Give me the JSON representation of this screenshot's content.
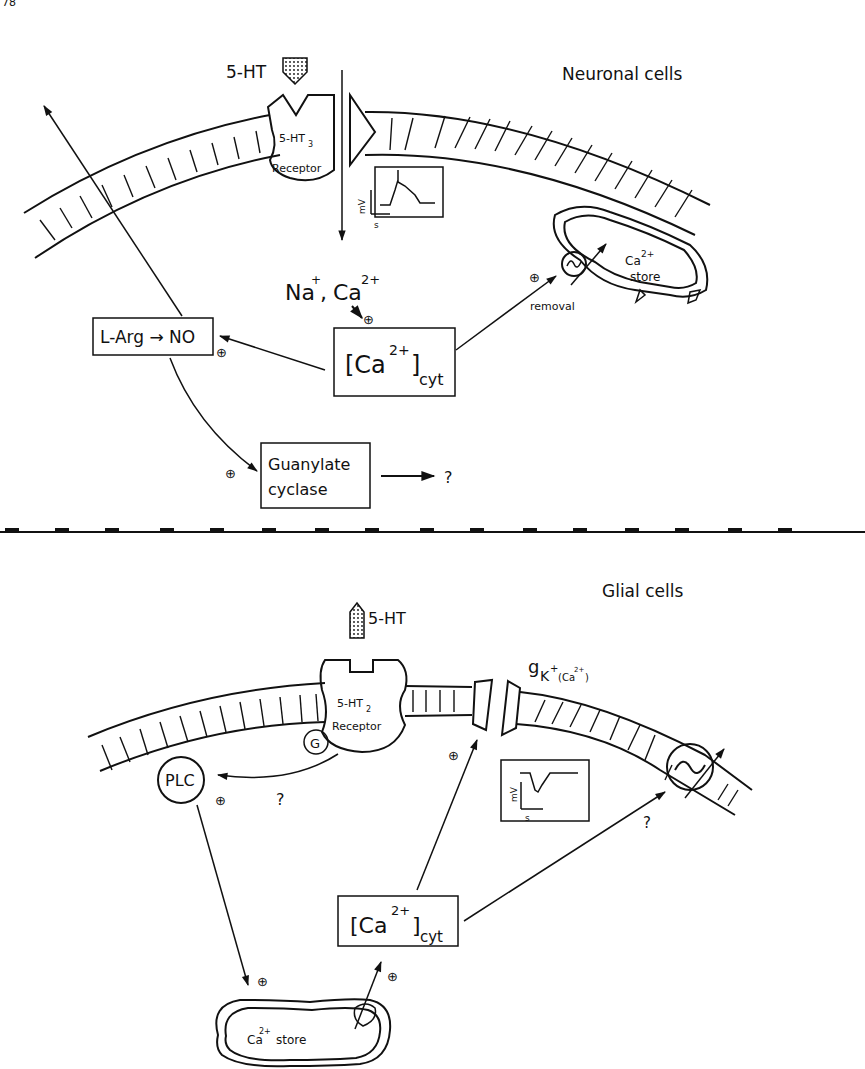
{
  "figure": {
    "page_fragment": "78",
    "panels": [
      {
        "id": "neuronal",
        "title": "Neuronal cells",
        "ligand": "5-HT",
        "receptor": {
          "name": "5-HT",
          "subtype": "3",
          "label": "Receptor"
        },
        "ions": {
          "na": "Na",
          "na_charge": "+",
          "comma": ",",
          "ca": "Ca",
          "ca_charge": "2+"
        },
        "ca_cyt": {
          "bracket_open": "[Ca",
          "charge": "2+",
          "bracket_close": "]",
          "sub": "cyt"
        },
        "larg_box": "L-Arg → NO",
        "guanylate": {
          "line1": "Guanylate",
          "line2": "cyclase"
        },
        "unknown": "?",
        "removal": "removal",
        "store": {
          "ca": "Ca",
          "charge": "2+",
          "word": "store"
        },
        "inset": {
          "y_axis": "mV",
          "x_axis": "s",
          "trace": "depolarization spike"
        },
        "plus": "⊕"
      },
      {
        "id": "glial",
        "title": "Glial cells",
        "ligand": "5-HT",
        "receptor": {
          "name": "5-HT",
          "subtype": "2",
          "label": "Receptor"
        },
        "g_protein": "G",
        "plc": "PLC",
        "unknown": "?",
        "gk": {
          "g": "g",
          "sub_k": "K",
          "sub_plus": "+",
          "paren": "(Ca",
          "paren_charge": "2+",
          "paren_close": ")"
        },
        "ca_cyt": {
          "bracket_open": "[Ca",
          "charge": "2+",
          "bracket_close": "]",
          "sub": "cyt"
        },
        "store": {
          "ca": "Ca",
          "charge": "2+",
          "word": "store"
        },
        "inset": {
          "y_axis": "mV",
          "x_axis": "s",
          "trace": "hyperpolarization"
        },
        "plus": "⊕"
      }
    ]
  }
}
